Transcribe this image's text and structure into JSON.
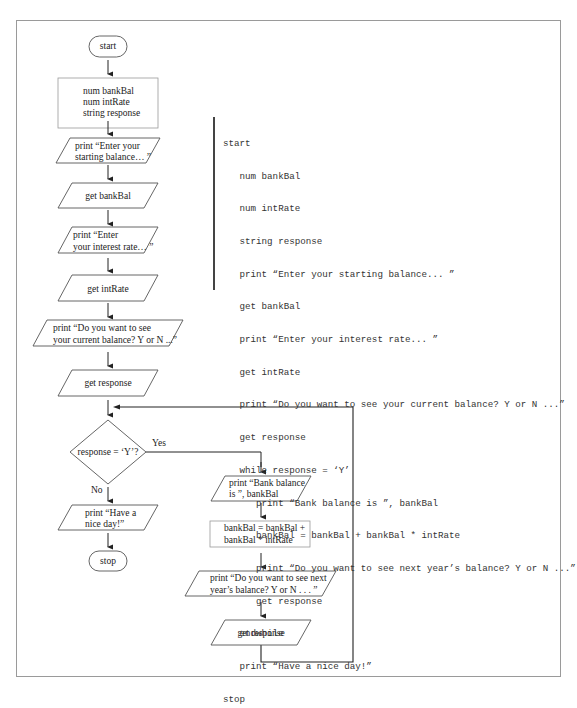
{
  "flowchart": {
    "start": "start",
    "declarations": [
      "num bankBal",
      "num intRate",
      "string response"
    ],
    "print_starting_balance": [
      "print “Enter your",
      "starting balance… ”"
    ],
    "get_bankBal": "get bankBal",
    "print_interest_rate": [
      "print “Enter",
      "your interest rate… ”"
    ],
    "get_intRate": "get intRate",
    "print_see_current": [
      "print “Do you want to see",
      "your current balance? Y or N ...”"
    ],
    "get_response_1": "get response",
    "decision": "response = ‘Y’?",
    "yes_label": "Yes",
    "no_label": "No",
    "print_nice_day": [
      "print “Have a",
      "nice day!”"
    ],
    "stop": "stop",
    "print_bank_balance": [
      "print “Bank balance",
      "is ”, bankBal"
    ],
    "compute_balance": [
      "bankBal = bankBal +",
      "bankBal * intRate"
    ],
    "print_see_next": [
      "print “Do you want to see next",
      "year’s balance? Y or N . . . ”"
    ],
    "get_response_2": "get response"
  },
  "pseudocode": {
    "lines": [
      "start",
      "   num bankBal",
      "   num intRate",
      "   string response",
      "   print “Enter your starting balance... ”",
      "   get bankBal",
      "   print “Enter your interest rate... ”",
      "   get intRate",
      "   print “Do you want to see your current balance? Y or N ...”",
      "   get response",
      "   while response = ‘Y’",
      "      print “Bank balance is ”, bankBal",
      "      bankBal = bankBal + bankBal * intRate",
      "      print “Do you want to see next year’s balance? Y or N ...”",
      "      get response",
      "   endwhile",
      "   print “Have a nice day!”",
      "stop"
    ]
  },
  "colors": {
    "line": "#333333",
    "shape_border": "#555555",
    "frame_border": "#9a9a9a",
    "text": "#222222"
  }
}
